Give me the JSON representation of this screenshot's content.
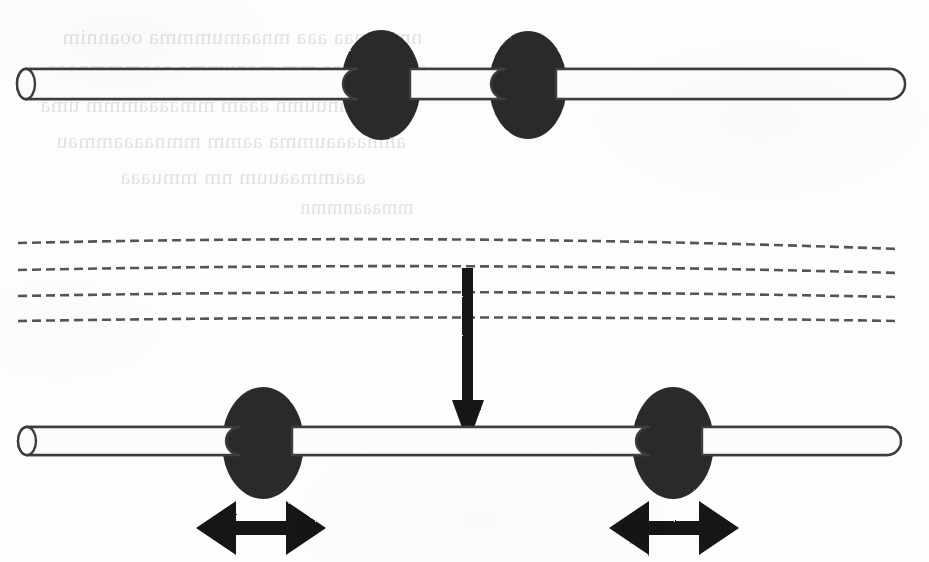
{
  "figure": {
    "kind": "scanned-line-diagram",
    "width": 929,
    "height": 562,
    "background_color": "#fdfdfc",
    "ink_color": "#1a1a1a",
    "bead_fill_color": "#2b2b2b",
    "rod_fill_color": "#fcfcfa",
    "rod_outline_color": "#3a3a3a",
    "dashed_line_color": "#555555",
    "caption": ""
  },
  "top_assembly": {
    "label": "top-rod-assembly",
    "rod": {
      "label": "rod",
      "left_x": 20,
      "right_x": 905,
      "center_y": 84,
      "thickness": 30,
      "left_cap": "ellipse-open-end",
      "right_cap": "rounded"
    },
    "beads": [
      {
        "label": "bead-top-left",
        "cx": 381,
        "cy": 85,
        "rx": 40,
        "ry": 55
      },
      {
        "label": "bead-top-right",
        "cx": 528,
        "cy": 85,
        "rx": 39,
        "ry": 54
      }
    ],
    "bead_separation_px": 147,
    "state": "beads-close-together"
  },
  "middle_band": {
    "label": "dashed-field-lines",
    "line_count": 4,
    "lines": [
      {
        "label": "dashed-line-1",
        "left_y": 243,
        "mid_y": 235,
        "right_y": 249
      },
      {
        "label": "dashed-line-2",
        "left_y": 270,
        "mid_y": 263,
        "right_y": 273
      },
      {
        "label": "dashed-line-3",
        "left_y": 296,
        "mid_y": 290,
        "right_y": 297
      },
      {
        "label": "dashed-line-4",
        "left_y": 321,
        "mid_y": 316,
        "right_y": 321
      }
    ],
    "left_x": 18,
    "right_x": 898,
    "dash_pattern": "9 5"
  },
  "transition_arrow": {
    "label": "downward-transition-arrow",
    "direction": "down",
    "shaft_x": 468,
    "shaft_top_y": 268,
    "shaft_width": 11,
    "head_tip_y": 444,
    "head_top_y": 400,
    "head_half_width": 16
  },
  "bottom_assembly": {
    "label": "bottom-rod-assembly",
    "rod": {
      "label": "rod",
      "left_x": 20,
      "right_x": 901,
      "center_y": 441,
      "thickness": 28,
      "left_cap": "ellipse-open-end",
      "right_cap": "rounded"
    },
    "beads": [
      {
        "label": "bead-bottom-left",
        "cx": 263,
        "cy": 443,
        "rx": 41,
        "ry": 56
      },
      {
        "label": "bead-bottom-right",
        "cx": 673,
        "cy": 443,
        "rx": 41,
        "ry": 56
      }
    ],
    "bead_separation_px": 410,
    "state": "beads-spread-apart"
  },
  "motion_arrows": [
    {
      "label": "double-headed-arrow-left",
      "direction": "horizontal-bidirectional",
      "left_x": 196,
      "right_x": 326,
      "center_y": 528,
      "shaft_thickness": 14,
      "head_half_height": 27,
      "head_length": 40
    },
    {
      "label": "double-headed-arrow-right",
      "direction": "horizontal-bidirectional",
      "left_x": 609,
      "right_x": 739,
      "center_y": 528,
      "shaft_thickness": 14,
      "head_half_height": 27,
      "head_length": 40
    }
  ],
  "bleed_through_text": {
    "label": "reverse-page-ghost-text",
    "legible": false,
    "lines": [
      {
        "text": "nmanmaa aaa mnaamummma ooannim",
        "x": 62,
        "y": 24,
        "size": 22
      },
      {
        "text": "aoammmaa mm manumma aaammmnaaa",
        "x": 46,
        "y": 56,
        "size": 22
      },
      {
        "text": "nmnuumn aaam mmaaaammm uma",
        "x": 40,
        "y": 92,
        "size": 22
      },
      {
        "text": "amnaaaaumma aamm mmnaaaammau",
        "x": 56,
        "y": 128,
        "size": 22
      },
      {
        "text": "aaammaauum nm mmuaaa",
        "x": 120,
        "y": 164,
        "size": 22
      },
      {
        "text": "mmaaanmmn",
        "x": 300,
        "y": 196,
        "size": 20
      }
    ]
  }
}
